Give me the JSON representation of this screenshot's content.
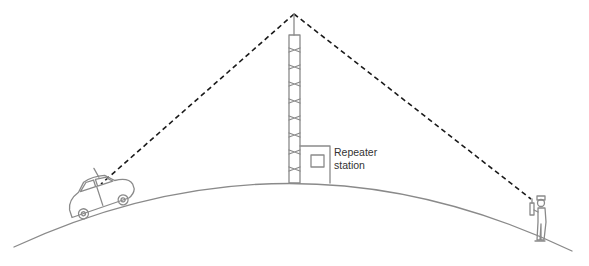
{
  "diagram": {
    "labels": {
      "station_line1": "Repeater",
      "station_line2": "station"
    },
    "elements": {
      "ground": "curved-earth-surface",
      "tower": "repeater-tower",
      "station": "repeater-station-building",
      "car": "vehicle-with-antenna",
      "person": "person-with-handheld-radio",
      "signal_paths": [
        "tower-to-car",
        "tower-to-person"
      ]
    },
    "colors": {
      "outline": "#8a8a8a",
      "signal": "#1a1a1a",
      "text": "#333333",
      "background": "#ffffff"
    }
  }
}
